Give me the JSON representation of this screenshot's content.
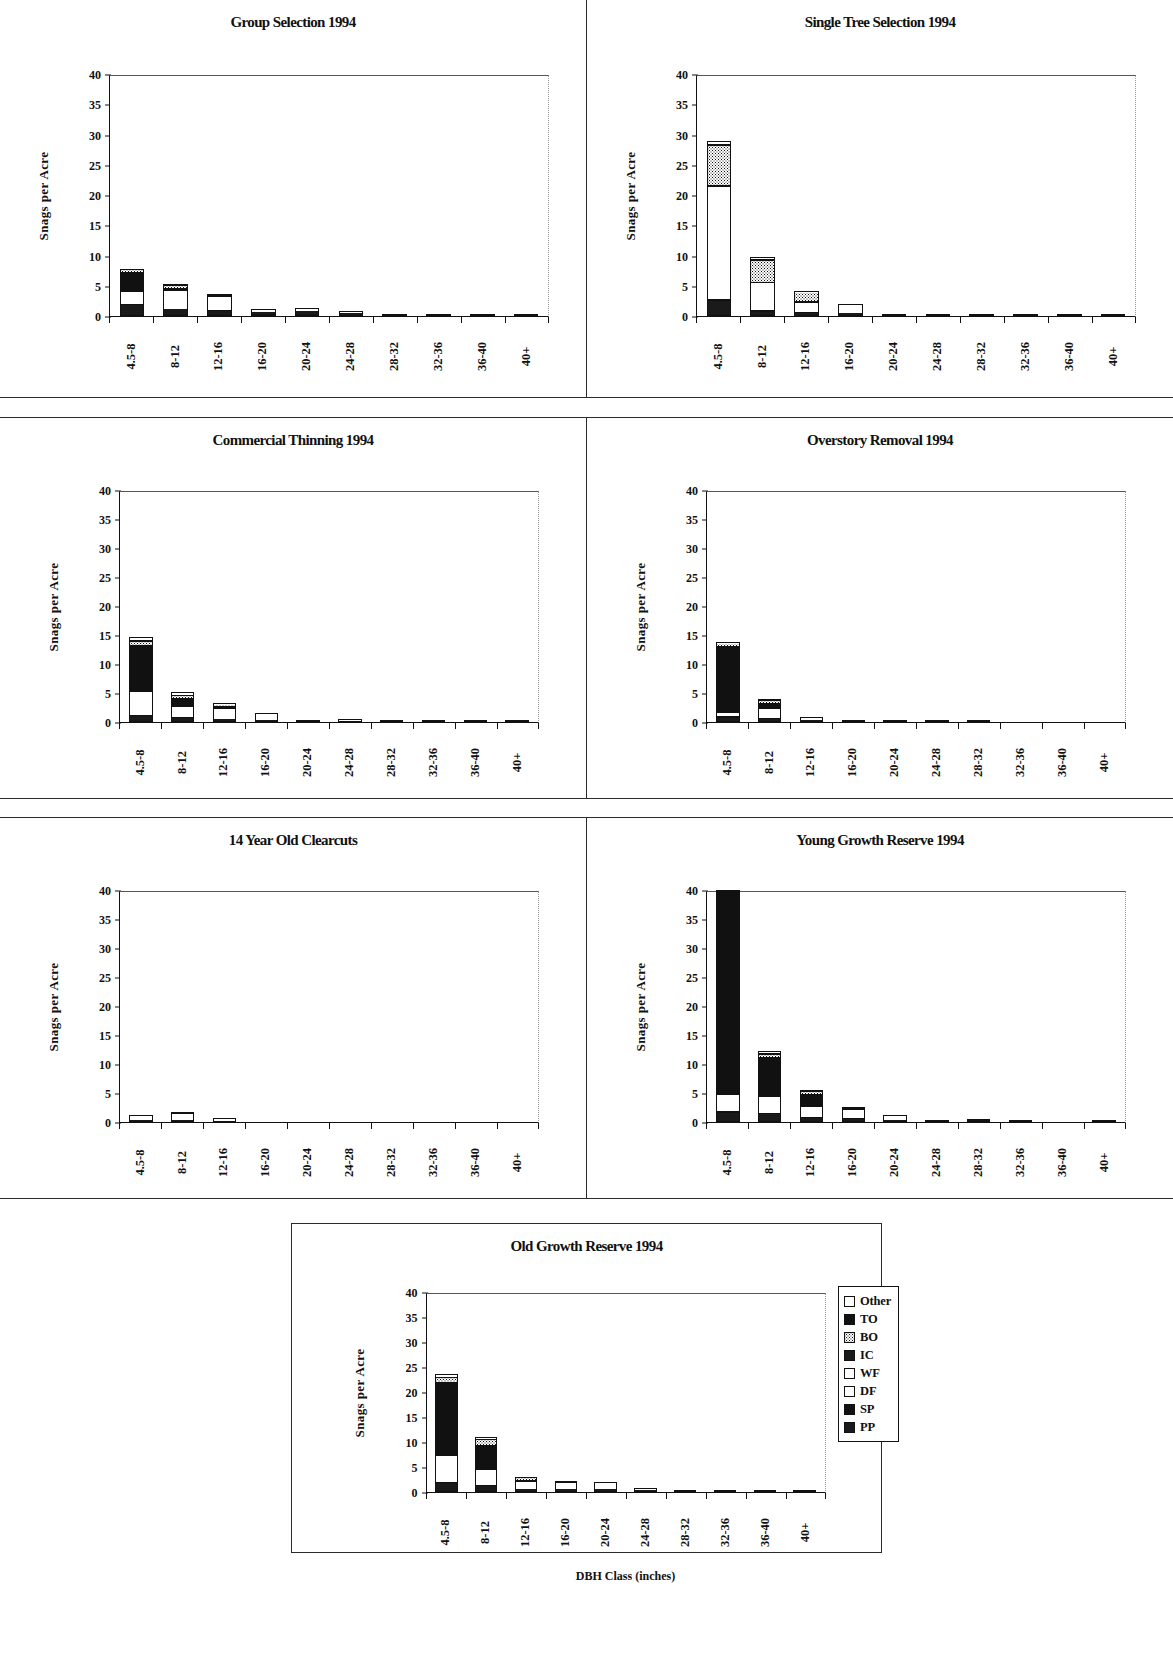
{
  "figure": {
    "xaxis_title": "DBH Class (inches)",
    "yaxis_title": "Snags per Acre",
    "categories": [
      "4.5-8",
      "8-12",
      "12-16",
      "16-20",
      "20-24",
      "24-28",
      "28-32",
      "32-36",
      "36-40",
      "40+"
    ],
    "yticks": [
      "0",
      "5",
      "10",
      "15",
      "20",
      "25",
      "30",
      "35",
      "40"
    ],
    "ylim": [
      0,
      40
    ]
  },
  "legend": {
    "items": [
      {
        "label": "Other",
        "fill": "f-white"
      },
      {
        "label": "TO",
        "fill": "f-black"
      },
      {
        "label": "BO",
        "fill": "f-dots"
      },
      {
        "label": "IC",
        "fill": "f-dark"
      },
      {
        "label": "WF",
        "fill": "f-white"
      },
      {
        "label": "DF",
        "fill": "f-white"
      },
      {
        "label": "SP",
        "fill": "f-black"
      },
      {
        "label": "PP",
        "fill": "f-dark"
      }
    ]
  },
  "chart_data": [
    {
      "type": "bar",
      "stacked": true,
      "panel": "top-left",
      "title": "Group Selection 1994",
      "xlabel": "",
      "ylabel": "Snags per Acre",
      "ylim": [
        0,
        40
      ],
      "categories": [
        "4.5-8",
        "8-12",
        "12-16",
        "16-20",
        "20-24",
        "24-28",
        "28-32",
        "32-36",
        "36-40",
        "40+"
      ],
      "series": [
        {
          "name": "PP",
          "values": [
            1.7,
            1.0,
            0.8,
            0.6,
            0.8,
            0.5,
            0.25,
            0.1,
            0.12,
            0.2
          ]
        },
        {
          "name": "SP",
          "values": [
            0.2,
            0.1,
            0.1,
            0.05,
            0.05,
            0.05,
            0.03,
            0.02,
            0.02,
            0.02
          ]
        },
        {
          "name": "DF",
          "values": [
            1.9,
            1.2,
            1.9,
            0.35,
            0.3,
            0.15,
            0.08,
            0.04,
            0.05,
            0.04
          ]
        },
        {
          "name": "WF",
          "values": [
            0.2,
            1.9,
            0.5,
            0.08,
            0.08,
            0.05,
            0.02,
            0.01,
            0.02,
            0.02
          ]
        },
        {
          "name": "IC",
          "values": [
            3.5,
            0.5,
            0.15,
            0.05,
            0.05,
            0.04,
            0.02,
            0.01,
            0.01,
            0.01
          ]
        },
        {
          "name": "BO",
          "values": [
            0.2,
            0.5,
            0.1,
            0.02,
            0.02,
            0.02,
            0.0,
            0.0,
            0.0,
            0.0
          ]
        },
        {
          "name": "TO",
          "values": [
            0.1,
            0.1,
            0.05,
            0.0,
            0.0,
            0.0,
            0.0,
            0.0,
            0.0,
            0.0
          ]
        },
        {
          "name": "Other",
          "values": [
            0.05,
            0.05,
            0.02,
            0.0,
            0.0,
            0.0,
            0.0,
            0.0,
            0.0,
            0.0
          ]
        }
      ],
      "totals": [
        7.85,
        5.35,
        3.62,
        1.15,
        1.3,
        0.81,
        0.4,
        0.18,
        0.22,
        0.29
      ]
    },
    {
      "type": "bar",
      "stacked": true,
      "panel": "top-right",
      "title": "Single Tree Selection 1994",
      "xlabel": "",
      "ylabel": "Snags per Acre",
      "ylim": [
        0,
        40
      ],
      "categories": [
        "4.5-8",
        "8-12",
        "12-16",
        "16-20",
        "20-24",
        "24-28",
        "28-32",
        "32-36",
        "36-40",
        "40+"
      ],
      "series": [
        {
          "name": "PP",
          "values": [
            2.4,
            0.6,
            0.4,
            0.3,
            0.0,
            0.1,
            0.1,
            0.0,
            0.0,
            0.15
          ]
        },
        {
          "name": "SP",
          "values": [
            0.3,
            0.2,
            0.1,
            0.1,
            0.0,
            0.03,
            0.03,
            0.0,
            0.0,
            0.03
          ]
        },
        {
          "name": "DF",
          "values": [
            18.5,
            4.2,
            1.0,
            1.4,
            0.05,
            0.1,
            0.12,
            0.03,
            0.02,
            0.05
          ]
        },
        {
          "name": "WF",
          "values": [
            0.2,
            0.4,
            0.6,
            0.1,
            0.02,
            0.04,
            0.04,
            0.0,
            0.0,
            0.02
          ]
        },
        {
          "name": "IC",
          "values": [
            0.3,
            0.3,
            0.5,
            0.08,
            0.0,
            0.02,
            0.02,
            0.0,
            0.0,
            0.0
          ]
        },
        {
          "name": "BO",
          "values": [
            6.6,
            3.6,
            1.3,
            0.04,
            0.0,
            0.0,
            0.0,
            0.0,
            0.0,
            0.0
          ]
        },
        {
          "name": "TO",
          "values": [
            0.3,
            0.3,
            0.1,
            0.0,
            0.0,
            0.0,
            0.0,
            0.0,
            0.0,
            0.0
          ]
        },
        {
          "name": "Other",
          "values": [
            0.4,
            0.2,
            0.08,
            0.0,
            0.0,
            0.0,
            0.0,
            0.0,
            0.0,
            0.0
          ]
        }
      ],
      "totals": [
        29.0,
        9.8,
        4.1,
        2.02,
        0.07,
        0.29,
        0.31,
        0.03,
        0.02,
        0.25
      ]
    },
    {
      "type": "bar",
      "stacked": true,
      "panel": "mid-left",
      "title": "Commercial Thinning 1994",
      "xlabel": "",
      "ylabel": "Snags per Acre",
      "ylim": [
        0,
        40
      ],
      "categories": [
        "4.5-8",
        "8-12",
        "12-16",
        "16-20",
        "20-24",
        "24-28",
        "28-32",
        "32-36",
        "36-40",
        "40+"
      ],
      "series": [
        {
          "name": "PP",
          "values": [
            0.8,
            0.5,
            0.3,
            0.2,
            0.1,
            0.1,
            0.03,
            0.02,
            0.1,
            0.02
          ]
        },
        {
          "name": "SP",
          "values": [
            0.3,
            0.2,
            0.1,
            0.05,
            0.03,
            0.03,
            0.01,
            0.01,
            0.03,
            0.0
          ]
        },
        {
          "name": "DF",
          "values": [
            3.6,
            1.6,
            1.5,
            1.1,
            0.18,
            0.3,
            0.06,
            0.03,
            0.12,
            0.02
          ]
        },
        {
          "name": "WF",
          "values": [
            0.4,
            0.3,
            0.5,
            0.1,
            0.05,
            0.05,
            0.02,
            0.0,
            0.04,
            0.0
          ]
        },
        {
          "name": "IC",
          "values": [
            8.4,
            1.6,
            0.5,
            0.1,
            0.04,
            0.04,
            0.01,
            0.0,
            0.03,
            0.0
          ]
        },
        {
          "name": "BO",
          "values": [
            0.5,
            0.5,
            0.2,
            0.03,
            0.0,
            0.0,
            0.0,
            0.0,
            0.0,
            0.0
          ]
        },
        {
          "name": "TO",
          "values": [
            0.3,
            0.2,
            0.08,
            0.0,
            0.0,
            0.0,
            0.0,
            0.0,
            0.0,
            0.0
          ]
        },
        {
          "name": "Other",
          "values": [
            0.3,
            0.2,
            0.05,
            0.0,
            0.0,
            0.0,
            0.0,
            0.0,
            0.0,
            0.0
          ]
        }
      ],
      "totals": [
        14.6,
        5.1,
        3.23,
        1.58,
        0.4,
        0.52,
        0.13,
        0.06,
        0.32,
        0.04
      ]
    },
    {
      "type": "bar",
      "stacked": true,
      "panel": "mid-right",
      "title": "Overstory Removal 1994",
      "xlabel": "",
      "ylabel": "Snags per Acre",
      "ylim": [
        0,
        40
      ],
      "categories": [
        "4.5-8",
        "8-12",
        "12-16",
        "16-20",
        "20-24",
        "24-28",
        "28-32",
        "32-36",
        "36-40",
        "40+"
      ],
      "series": [
        {
          "name": "PP",
          "values": [
            0.6,
            0.4,
            0.15,
            0.05,
            0.06,
            0.03,
            0.0,
            0.0,
            0.0,
            0.0
          ]
        },
        {
          "name": "SP",
          "values": [
            0.2,
            0.1,
            0.05,
            0.02,
            0.02,
            0.01,
            0.0,
            0.0,
            0.0,
            0.0
          ]
        },
        {
          "name": "DF",
          "values": [
            0.5,
            1.5,
            0.45,
            0.1,
            0.12,
            0.06,
            0.02,
            0.0,
            0.0,
            0.0
          ]
        },
        {
          "name": "WF",
          "values": [
            0.2,
            0.3,
            0.1,
            0.02,
            0.03,
            0.01,
            0.0,
            0.0,
            0.0,
            0.0
          ]
        },
        {
          "name": "IC",
          "values": [
            11.8,
            1.1,
            0.1,
            0.02,
            0.02,
            0.01,
            0.0,
            0.0,
            0.0,
            0.0
          ]
        },
        {
          "name": "BO",
          "values": [
            0.3,
            0.4,
            0.05,
            0.0,
            0.0,
            0.0,
            0.0,
            0.0,
            0.0,
            0.0
          ]
        },
        {
          "name": "TO",
          "values": [
            0.1,
            0.1,
            0.02,
            0.0,
            0.0,
            0.0,
            0.0,
            0.0,
            0.0,
            0.0
          ]
        },
        {
          "name": "Other",
          "values": [
            0.1,
            0.1,
            0.02,
            0.0,
            0.0,
            0.0,
            0.0,
            0.0,
            0.0,
            0.0
          ]
        }
      ],
      "totals": [
        13.8,
        4.0,
        0.94,
        0.21,
        0.25,
        0.12,
        0.02,
        0.0,
        0.0,
        0.0
      ]
    },
    {
      "type": "bar",
      "stacked": true,
      "panel": "bot-left",
      "title": "14 Year Old Clearcuts",
      "xlabel": "",
      "ylabel": "Snags per Acre",
      "ylim": [
        0,
        40
      ],
      "categories": [
        "4.5-8",
        "8-12",
        "12-16",
        "16-20",
        "20-24",
        "24-28",
        "28-32",
        "32-36",
        "36-40",
        "40+"
      ],
      "series": [
        {
          "name": "PP",
          "values": [
            0.15,
            0.2,
            0.1,
            0.0,
            0.0,
            0.0,
            0.0,
            0.0,
            0.0,
            0.0
          ]
        },
        {
          "name": "SP",
          "values": [
            0.05,
            0.05,
            0.03,
            0.0,
            0.0,
            0.0,
            0.0,
            0.0,
            0.0,
            0.0
          ]
        },
        {
          "name": "DF",
          "values": [
            0.9,
            1.3,
            0.6,
            0.0,
            0.0,
            0.0,
            0.0,
            0.0,
            0.0,
            0.0
          ]
        },
        {
          "name": "WF",
          "values": [
            0.05,
            0.05,
            0.02,
            0.0,
            0.0,
            0.0,
            0.0,
            0.0,
            0.0,
            0.0
          ]
        },
        {
          "name": "IC",
          "values": [
            0.05,
            0.05,
            0.02,
            0.0,
            0.0,
            0.0,
            0.0,
            0.0,
            0.0,
            0.0
          ]
        },
        {
          "name": "BO",
          "values": [
            0.0,
            0.0,
            0.0,
            0.0,
            0.0,
            0.0,
            0.0,
            0.0,
            0.0,
            0.0
          ]
        },
        {
          "name": "TO",
          "values": [
            0.0,
            0.0,
            0.0,
            0.0,
            0.0,
            0.0,
            0.0,
            0.0,
            0.0,
            0.0
          ]
        },
        {
          "name": "Other",
          "values": [
            0.0,
            0.0,
            0.0,
            0.0,
            0.0,
            0.0,
            0.0,
            0.0,
            0.0,
            0.0
          ]
        }
      ],
      "totals": [
        1.2,
        1.65,
        0.77,
        0.0,
        0.0,
        0.0,
        0.0,
        0.0,
        0.0,
        0.0
      ]
    },
    {
      "type": "bar",
      "stacked": true,
      "panel": "bot-right",
      "title": "Young Growth Reserve 1994",
      "xlabel": "",
      "ylabel": "Snags per Acre",
      "ylim": [
        0,
        40
      ],
      "note": "first bar exceeds axis maximum and is clipped at 40",
      "categories": [
        "4.5-8",
        "8-12",
        "12-16",
        "16-20",
        "20-24",
        "24-28",
        "28-32",
        "32-36",
        "36-40",
        "40+"
      ],
      "series": [
        {
          "name": "PP",
          "values": [
            1.4,
            1.2,
            0.5,
            0.4,
            0.2,
            0.08,
            0.1,
            0.0,
            0.0,
            0.06
          ]
        },
        {
          "name": "SP",
          "values": [
            0.3,
            0.3,
            0.15,
            0.1,
            0.05,
            0.02,
            0.03,
            0.0,
            0.0,
            0.02
          ]
        },
        {
          "name": "DF",
          "values": [
            2.1,
            2.3,
            1.6,
            1.4,
            0.6,
            0.12,
            0.2,
            0.02,
            0.0,
            0.05
          ]
        },
        {
          "name": "WF",
          "values": [
            0.8,
            0.5,
            0.4,
            0.2,
            0.1,
            0.04,
            0.05,
            0.0,
            0.0,
            0.02
          ]
        },
        {
          "name": "IC",
          "values": [
            35.4,
            7.0,
            2.4,
            0.5,
            0.15,
            0.06,
            0.07,
            0.0,
            0.0,
            0.0
          ]
        },
        {
          "name": "BO",
          "values": [
            0.6,
            0.5,
            0.3,
            0.05,
            0.03,
            0.0,
            0.0,
            0.0,
            0.0,
            0.0
          ]
        },
        {
          "name": "TO",
          "values": [
            0.2,
            0.2,
            0.1,
            0.02,
            0.0,
            0.0,
            0.0,
            0.0,
            0.0,
            0.0
          ]
        },
        {
          "name": "Other",
          "values": [
            0.2,
            0.2,
            0.05,
            0.0,
            0.0,
            0.0,
            0.0,
            0.0,
            0.0,
            0.0
          ]
        }
      ],
      "totals": [
        41.0,
        12.2,
        5.5,
        2.67,
        1.13,
        0.32,
        0.45,
        0.02,
        0.0,
        0.15
      ]
    },
    {
      "type": "bar",
      "stacked": true,
      "panel": "bottom-center",
      "title": "Old Growth Reserve 1994",
      "xlabel": "DBH Class (inches)",
      "ylabel": "Snags per Acre",
      "ylim": [
        0,
        40
      ],
      "categories": [
        "4.5-8",
        "8-12",
        "12-16",
        "16-20",
        "20-24",
        "24-28",
        "28-32",
        "32-36",
        "36-40",
        "40+"
      ],
      "series": [
        {
          "name": "PP",
          "values": [
            1.6,
            1.0,
            0.4,
            0.4,
            0.4,
            0.2,
            0.05,
            0.0,
            0.0,
            0.05
          ]
        },
        {
          "name": "SP",
          "values": [
            0.3,
            0.3,
            0.1,
            0.1,
            0.1,
            0.05,
            0.02,
            0.0,
            0.0,
            0.02
          ]
        },
        {
          "name": "DF",
          "values": [
            4.8,
            2.6,
            1.3,
            1.3,
            1.2,
            0.5,
            0.1,
            0.02,
            0.02,
            0.05
          ]
        },
        {
          "name": "WF",
          "values": [
            0.4,
            0.5,
            0.3,
            0.2,
            0.2,
            0.08,
            0.03,
            0.0,
            0.0,
            0.02
          ]
        },
        {
          "name": "IC",
          "values": [
            15.0,
            5.2,
            0.5,
            0.2,
            0.15,
            0.07,
            0.02,
            0.0,
            0.0,
            0.0
          ]
        },
        {
          "name": "BO",
          "values": [
            0.9,
            1.0,
            0.3,
            0.05,
            0.03,
            0.0,
            0.0,
            0.0,
            0.0,
            0.0
          ]
        },
        {
          "name": "TO",
          "values": [
            0.3,
            0.3,
            0.1,
            0.0,
            0.0,
            0.0,
            0.0,
            0.0,
            0.0,
            0.0
          ]
        },
        {
          "name": "Other",
          "values": [
            0.3,
            0.2,
            0.05,
            0.0,
            0.0,
            0.0,
            0.0,
            0.0,
            0.0,
            0.0
          ]
        }
      ],
      "totals": [
        23.6,
        11.1,
        3.05,
        2.25,
        2.08,
        0.9,
        0.22,
        0.02,
        0.02,
        0.14
      ]
    }
  ]
}
